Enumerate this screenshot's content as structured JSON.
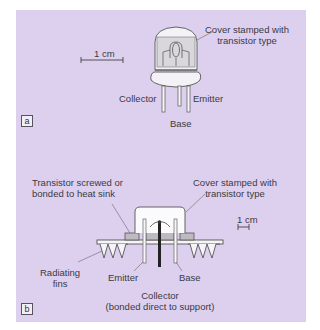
{
  "figure": {
    "background_color": "#ddd0ef",
    "panel_a": {
      "tag": "a",
      "scale_label": "1 cm",
      "callouts": {
        "cover": [
          "Cover stamped with",
          "transistor type"
        ],
        "collector": "Collector",
        "emitter": "Emitter",
        "base": "Base"
      }
    },
    "panel_b": {
      "tag": "b",
      "scale_label": "1 cm",
      "callouts": {
        "screwed": [
          "Transistor screwed or",
          "bonded to heat sink"
        ],
        "cover": [
          "Cover stamped with",
          "transistor type"
        ],
        "fins": [
          "Radiating",
          "fins"
        ],
        "emitter": "Emitter",
        "base": "Base",
        "collector": [
          "Collector",
          "(bonded direct to support)"
        ]
      }
    }
  }
}
